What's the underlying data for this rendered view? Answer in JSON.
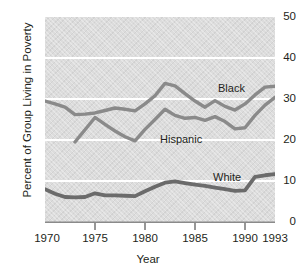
{
  "chart_data": {
    "type": "line",
    "title": "",
    "xlabel": "Year",
    "ylabel": "Percent of Group Living in Poverty",
    "xlim": [
      1970,
      1993
    ],
    "ylim": [
      0,
      50
    ],
    "xticks": [
      1970,
      1975,
      1980,
      1985,
      1990,
      1993
    ],
    "yticks": [
      0,
      10,
      20,
      30,
      40,
      50
    ],
    "grid": "horizontal-white",
    "legend": "inline-labels",
    "x": [
      1970,
      1971,
      1972,
      1973,
      1974,
      1975,
      1976,
      1977,
      1978,
      1979,
      1980,
      1981,
      1982,
      1983,
      1984,
      1985,
      1986,
      1987,
      1988,
      1989,
      1990,
      1991,
      1992,
      1993
    ],
    "series": [
      {
        "name": "Black",
        "color": "#8a8a8a",
        "label_text": "Black",
        "values": [
          29.5,
          28.8,
          28.0,
          26.2,
          26.3,
          26.6,
          27.2,
          27.8,
          27.5,
          27.1,
          28.8,
          30.8,
          33.8,
          33.2,
          31.3,
          29.5,
          28.0,
          29.6,
          28.2,
          27.3,
          28.8,
          31.0,
          32.9,
          33.1
        ]
      },
      {
        "name": "Hispanic",
        "color": "#8a8a8a",
        "label_text": "Hispanic",
        "values": [
          null,
          null,
          null,
          19.5,
          22.5,
          25.5,
          23.8,
          22.2,
          20.8,
          19.8,
          22.6,
          25.0,
          27.5,
          26.0,
          25.3,
          25.5,
          24.8,
          25.7,
          24.5,
          22.7,
          23.0,
          26.0,
          28.5,
          30.4
        ]
      },
      {
        "name": "White",
        "color": "#6b6b6b",
        "label_text": "White",
        "values": [
          8.0,
          6.9,
          6.1,
          6.0,
          6.1,
          7.0,
          6.5,
          6.5,
          6.4,
          6.3,
          7.5,
          8.6,
          9.6,
          9.9,
          9.5,
          9.1,
          8.8,
          8.4,
          8.0,
          7.6,
          7.7,
          11.0,
          11.4,
          11.7
        ]
      }
    ],
    "annotations": [
      {
        "name": "black-label",
        "text": "Black",
        "x_px": 218,
        "y_px": 88
      },
      {
        "name": "hispanic-label",
        "text": "Hispanic",
        "x_px": 160,
        "y_px": 139
      },
      {
        "name": "white-label",
        "text": "White",
        "x_px": 213,
        "y_px": 177
      }
    ]
  }
}
